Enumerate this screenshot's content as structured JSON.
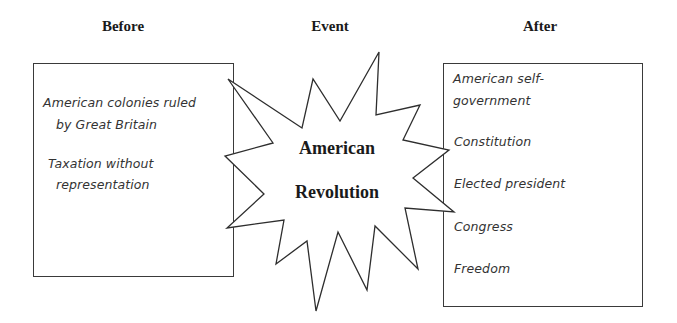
{
  "headings": {
    "before": "Before",
    "event": "Event",
    "after": "After"
  },
  "before": {
    "items": [
      {
        "line1": "American colonies ruled",
        "line2": "by Great Britain"
      },
      {
        "line1": "Taxation without",
        "line2": "representation"
      }
    ]
  },
  "event": {
    "line1": "American",
    "line2": "Revolution",
    "shape": "starburst"
  },
  "after": {
    "items": [
      {
        "line1": "American self-",
        "line2": "government"
      },
      {
        "line1": "Constitution"
      },
      {
        "line1": "Elected president"
      },
      {
        "line1": "Congress"
      },
      {
        "line1": "Freedom"
      }
    ]
  },
  "colors": {
    "stroke": "#3a3a3a",
    "background": "#ffffff",
    "text": "#1a1a1a"
  }
}
